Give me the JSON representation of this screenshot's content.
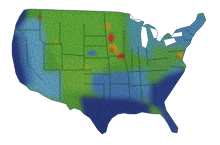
{
  "map": {
    "title": "Continental United States heat map",
    "region": "Contiguous United States",
    "legend": null,
    "color_scale": {
      "low": "#2e3f8a",
      "low_mid": "#4f86c6",
      "mid": "#6cb4d6",
      "mid_high": "#5fae3e",
      "high": "#7cc043",
      "hot": "#e3a52a",
      "hottest": "#d8432a"
    },
    "colors": {
      "background": "#ffffff",
      "state_borders": "#1d3a1a"
    },
    "zones": [
      {
        "name": "pacific-northwest-coast",
        "tone": "low"
      },
      {
        "name": "california-coast",
        "tone": "low"
      },
      {
        "name": "great-basin",
        "tone": "mid"
      },
      {
        "name": "southwest",
        "tone": "mid"
      },
      {
        "name": "northern-rockies-plains",
        "tone": "high"
      },
      {
        "name": "central-plains",
        "tone": "high"
      },
      {
        "name": "corn-belt",
        "tone": "hottest"
      },
      {
        "name": "great-lakes",
        "tone": "mid"
      },
      {
        "name": "northeast",
        "tone": "mid"
      },
      {
        "name": "mid-atlantic-hotspot",
        "tone": "hot"
      },
      {
        "name": "south-central",
        "tone": "low_mid"
      },
      {
        "name": "gulf-coast",
        "tone": "low"
      },
      {
        "name": "southeast",
        "tone": "low"
      },
      {
        "name": "florida",
        "tone": "low"
      }
    ]
  }
}
